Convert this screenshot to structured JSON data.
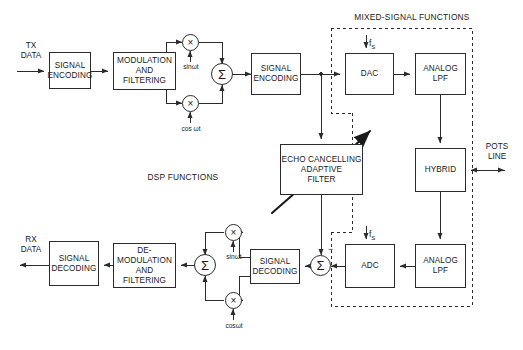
{
  "diagram": {
    "sections": {
      "mixed_signal": "MIXED-SIGNAL FUNCTIONS",
      "dsp": "DSP FUNCTIONS"
    },
    "ports": {
      "tx_data": "TX\nDATA",
      "rx_data": "RX\nDATA",
      "pots_line": "POTS\nLINE"
    },
    "blocks": {
      "tx_signal_encoding": "SIGNAL\nENCODING",
      "modulation_filtering": "MODULATION\nAND\nFILTERING",
      "tx_signal_encoding_2": "SIGNAL\nENCODING",
      "dac": "DAC",
      "analog_lpf_tx": "ANALOG\nLPF",
      "hybrid": "HYBRID",
      "echo_canceller": "ECHO CANCELLING\nADAPTIVE\nFILTER",
      "analog_lpf_rx": "ANALOG\nLPF",
      "adc": "ADC",
      "rx_signal_decoding": "SIGNAL\nDECODING",
      "demodulation_filtering": "DE-\nMODULATION\nAND\nFILTERING",
      "rx_signal_decoding_out": "SIGNAL\nDECODING"
    },
    "carriers": {
      "tx_sin": "sinωt",
      "tx_cos": "cos ωt",
      "rx_sin": "sinωt",
      "rx_cos": "cosωt"
    },
    "operators": {
      "mixer": "×",
      "summer": "Σ",
      "minus": "−"
    },
    "clocks": {
      "fs_tx": "f",
      "fs_tx_sub": "S",
      "fs_rx": "f",
      "fs_rx_sub": "S"
    },
    "colors": {
      "line": "#2b2b2b",
      "text": "#1a1a1a",
      "background": "#ffffff"
    }
  }
}
